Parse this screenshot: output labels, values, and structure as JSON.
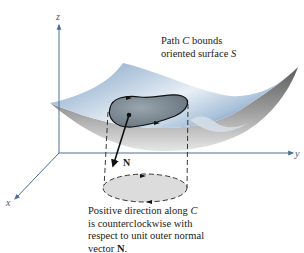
{
  "figure": {
    "axes": {
      "x_label": "x",
      "y_label": "y",
      "z_label": "z",
      "color": "#4a6e94"
    },
    "surface": {
      "name": "S",
      "top_color": "#8fb0cf",
      "highlight_color": "#e8eef5",
      "underside_color": "#8a8a8a"
    },
    "path": {
      "name": "C",
      "fill_color": "#7b8790"
    },
    "normal_vector": {
      "label": "N"
    },
    "projection_disc": {
      "fill_color": "#dcdcdc"
    },
    "annotation_top": {
      "line1_prefix": "Path ",
      "line1_var": "C",
      "line1_suffix": " bounds",
      "line2_prefix": "oriented surface ",
      "line2_var": "S"
    },
    "annotation_bottom": {
      "line1_prefix": "Positive direction along ",
      "line1_var": "C",
      "line2": "is counterclockwise with",
      "line3": "respect to unit outer normal",
      "line4_prefix": "vector ",
      "line4_bold": "N",
      "line4_suffix": "."
    }
  }
}
